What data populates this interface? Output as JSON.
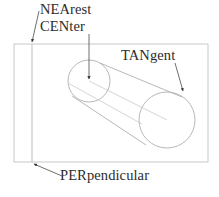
{
  "diagram": {
    "type": "technical-geometry-annotation",
    "background_color": "#ffffff",
    "stroke_color": "#b9b9b9",
    "text_color": "#2b2b2b",
    "labels": {
      "nearest": "NEArest",
      "center": "CENter",
      "tangent": "TANgent",
      "perpendicular": "PERpendicular"
    },
    "shapes": {
      "bounding_rect": {
        "name": "outer-rectangle",
        "x": 14,
        "y": 44,
        "width": 194,
        "height": 118
      },
      "reference_line": {
        "name": "vertical-reference-line",
        "x": 32,
        "y_top": 44,
        "y_bottom": 162
      },
      "near_circle": {
        "name": "left-end-circle",
        "cx": 89,
        "cy": 81,
        "r": 21
      },
      "far_circle": {
        "name": "right-end-circle",
        "cx": 167,
        "cy": 120,
        "r": 28
      }
    },
    "leaders": {
      "nearest": {
        "from_x": 39,
        "from_y": 10,
        "to_x": 32,
        "to_y": 43
      },
      "center": {
        "from_x": 89,
        "from_y": 33,
        "to_x": 89,
        "to_y": 80
      },
      "tangent": {
        "from_x": 176,
        "from_y": 62,
        "to_x": 183,
        "to_y": 92
      },
      "perpendicular": {
        "from_x": 62,
        "from_y": 176,
        "to_x": 34,
        "to_y": 164
      }
    }
  }
}
